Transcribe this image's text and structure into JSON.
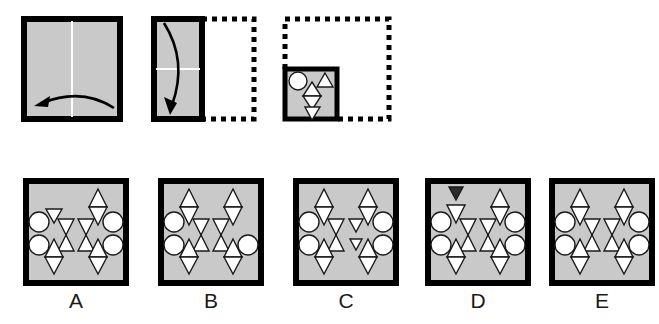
{
  "puzzle": {
    "type": "paper-folding-hole-punch",
    "colors": {
      "paper_fill": "#c9c9c9",
      "paper_stroke": "#000000",
      "hole_fill": "#ffffff",
      "hole_stroke": "#1a1a1a",
      "crease_line": "#ffffff",
      "dotted_outline": "#000000",
      "arrow": "#000000",
      "filled_shape": "#2b2b2b",
      "label_text": "#1a1a1a",
      "background": "#ffffff"
    },
    "sequence": {
      "name": "fold-sequence",
      "steps": [
        {
          "id": "step-1",
          "shape": "square",
          "crease": "vertical",
          "fold_direction": "right-to-left",
          "arrow": "curved-left",
          "ghost_outline": false
        },
        {
          "id": "step-2",
          "shape": "vertical-rectangle",
          "crease": "horizontal",
          "fold_direction": "top-to-bottom",
          "arrow": "curved-down",
          "ghost_outline": true
        },
        {
          "id": "step-3",
          "shape": "small-square",
          "crease": "none",
          "fold_direction": "none",
          "arrow": "none",
          "ghost_outline": true,
          "punches": [
            {
              "name": "circle-punch",
              "shape": "circle",
              "position": "top-left"
            },
            {
              "name": "triangle-up-punch",
              "shape": "triangle-up",
              "position": "top-right"
            },
            {
              "name": "triangle-up-punch-center",
              "shape": "triangle-up",
              "position": "center-upper"
            },
            {
              "name": "triangle-down-punch-center",
              "shape": "triangle-down",
              "position": "center-lower"
            },
            {
              "name": "triangle-down-punch-bottom",
              "shape": "triangle-down",
              "position": "bottom-center"
            }
          ]
        }
      ]
    },
    "options": [
      {
        "id": "option-a",
        "label": "A",
        "circles": 4,
        "circle_positions": [
          "left-upper",
          "left-lower",
          "right-upper",
          "right-lower"
        ],
        "corner_diamonds": [
          "top-right",
          "bottom-left",
          "bottom-right"
        ],
        "top_left_mark": "triangle-down-small",
        "center_pattern": "hourglass-pair",
        "filled_shape": false,
        "symmetric": false
      },
      {
        "id": "option-b",
        "label": "B",
        "circles": 3,
        "circle_positions": [
          "left-upper",
          "left-lower",
          "right-lower"
        ],
        "corner_diamonds": [
          "top-left",
          "top-right",
          "bottom-left",
          "bottom-right"
        ],
        "top_left_mark": "none",
        "center_pattern": "hourglass-pair",
        "filled_shape": false,
        "symmetric": false
      },
      {
        "id": "option-c",
        "label": "C",
        "circles": 4,
        "circle_positions": [
          "left-upper",
          "left-lower",
          "right-upper",
          "right-lower"
        ],
        "corner_diamonds": [
          "top-left",
          "top-right",
          "bottom-left",
          "bottom-right"
        ],
        "top_left_mark": "none",
        "center_pattern": "single-hourglass-plus-triangles",
        "filled_shape": false,
        "symmetric": false
      },
      {
        "id": "option-d",
        "label": "D",
        "circles": 4,
        "circle_positions": [
          "left-upper",
          "left-lower",
          "right-upper",
          "right-lower"
        ],
        "corner_diamonds": [
          "top-right",
          "bottom-left",
          "bottom-right"
        ],
        "top_left_mark": "triangle-down-filled",
        "center_pattern": "hourglass-pair",
        "filled_shape": true,
        "symmetric": false
      },
      {
        "id": "option-e",
        "label": "E",
        "circles": 4,
        "circle_positions": [
          "left-upper",
          "left-lower",
          "right-upper",
          "right-lower"
        ],
        "corner_diamonds": [
          "top-left",
          "top-right",
          "bottom-left",
          "bottom-right"
        ],
        "top_left_mark": "none",
        "center_pattern": "hourglass-pair",
        "filled_shape": false,
        "symmetric": true
      }
    ]
  }
}
